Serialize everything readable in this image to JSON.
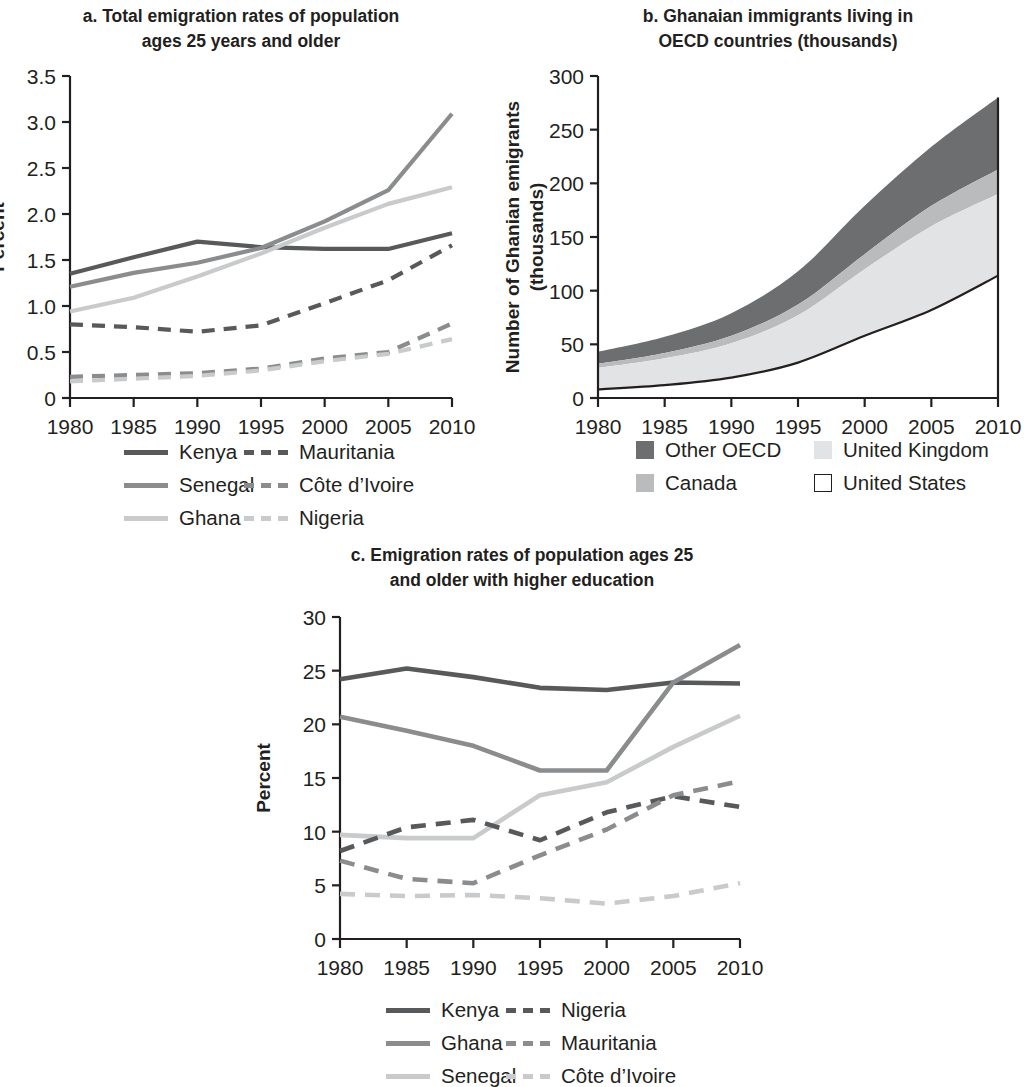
{
  "panels": {
    "a": {
      "title_line1": "a. Total emigration rates of population",
      "title_line2": "ages 25 years and older",
      "ylabel": "Percent",
      "yticks": [
        "3.5",
        "3.0",
        "2.5",
        "2.0",
        "1.5",
        "1.0",
        "0.5",
        "0"
      ],
      "xticks": [
        "1980",
        "1985",
        "1990",
        "1995",
        "2000",
        "2005",
        "2010"
      ],
      "legend": [
        {
          "label": "Kenya",
          "style": "solid",
          "color": "#58595b"
        },
        {
          "label": "Mauritania",
          "style": "dashed",
          "color": "#58595b"
        },
        {
          "label": "Senegal",
          "style": "solid",
          "color": "#8a8c8e"
        },
        {
          "label": "Côte d’Ivoire",
          "style": "dashed",
          "color": "#8a8c8e"
        },
        {
          "label": "Ghana",
          "style": "solid",
          "color": "#c8cacb"
        },
        {
          "label": "Nigeria",
          "style": "dashed",
          "color": "#c8cacb"
        }
      ]
    },
    "b": {
      "title_line1": "b. Ghanaian immigrants living in",
      "title_line2": "OECD countries (thousands)",
      "ylabel_line1": "Number of Ghanian emigrants",
      "ylabel_line2": "(thousands)",
      "yticks": [
        "300",
        "250",
        "200",
        "150",
        "100",
        "50",
        "0"
      ],
      "xticks": [
        "1980",
        "1985",
        "1990",
        "1995",
        "2000",
        "2005",
        "2010"
      ],
      "legend": [
        {
          "label": "Other OECD",
          "color": "#6d6e70",
          "swatch": "filled"
        },
        {
          "label": "United Kingdom",
          "color": "#e2e3e4",
          "swatch": "filled"
        },
        {
          "label": "Canada",
          "color": "#b9bbbd",
          "swatch": "filled"
        },
        {
          "label": "United States",
          "color": "#ffffff",
          "swatch": "outline"
        }
      ]
    },
    "c": {
      "title_line1": "c. Emigration rates of population ages 25",
      "title_line2": "and older with higher education",
      "ylabel": "Percent",
      "yticks": [
        "30",
        "25",
        "20",
        "15",
        "10",
        "5",
        "0"
      ],
      "xticks": [
        "1980",
        "1985",
        "1990",
        "1995",
        "2000",
        "2005",
        "2010"
      ],
      "legend": [
        {
          "label": "Kenya",
          "style": "solid",
          "color": "#58595b"
        },
        {
          "label": "Nigeria",
          "style": "dashed",
          "color": "#58595b"
        },
        {
          "label": "Ghana",
          "style": "solid",
          "color": "#8a8c8e"
        },
        {
          "label": "Mauritania",
          "style": "dashed",
          "color": "#8a8c8e"
        },
        {
          "label": "Senegal",
          "style": "solid",
          "color": "#c8cacb"
        },
        {
          "label": "Côte d’Ivoire",
          "style": "dashed",
          "color": "#c8cacb"
        }
      ]
    }
  },
  "chart_data": [
    {
      "panel": "a",
      "type": "line",
      "title": "a. Total emigration rates of population ages 25 years and older",
      "xlabel": "",
      "ylabel": "Percent",
      "x": [
        1980,
        1985,
        1990,
        1995,
        2000,
        2005,
        2010
      ],
      "xlim": [
        1980,
        2010
      ],
      "ylim": [
        0,
        3.5
      ],
      "ytick_values": [
        0,
        0.5,
        1.0,
        1.5,
        2.0,
        2.5,
        3.0,
        3.5
      ],
      "grid": false,
      "legend_position": "below",
      "series": [
        {
          "name": "Kenya",
          "style": "solid",
          "color": "#58595b",
          "values": [
            1.35,
            1.53,
            1.7,
            1.64,
            1.62,
            1.62,
            1.79
          ]
        },
        {
          "name": "Senegal",
          "style": "solid",
          "color": "#8a8c8e",
          "values": [
            1.21,
            1.36,
            1.47,
            1.63,
            1.92,
            2.26,
            3.09
          ]
        },
        {
          "name": "Ghana",
          "style": "solid",
          "color": "#c8cacb",
          "values": [
            0.94,
            1.09,
            1.32,
            1.57,
            1.85,
            2.11,
            2.29
          ]
        },
        {
          "name": "Mauritania",
          "style": "dashed",
          "color": "#58595b",
          "values": [
            0.8,
            0.77,
            0.72,
            0.79,
            1.03,
            1.28,
            1.66
          ]
        },
        {
          "name": "Côte d’Ivoire",
          "style": "dashed",
          "color": "#8a8c8e",
          "values": [
            0.23,
            0.25,
            0.27,
            0.32,
            0.43,
            0.5,
            0.81
          ]
        },
        {
          "name": "Nigeria",
          "style": "dashed",
          "color": "#c8cacb",
          "values": [
            0.18,
            0.21,
            0.24,
            0.3,
            0.4,
            0.48,
            0.64
          ]
        }
      ]
    },
    {
      "panel": "b",
      "type": "area",
      "title": "b. Ghanaian immigrants living in OECD countries (thousands)",
      "xlabel": "",
      "ylabel": "Number of Ghanian emigrants (thousands)",
      "x": [
        1980,
        1985,
        1990,
        1995,
        2000,
        2005,
        2010
      ],
      "xlim": [
        1980,
        2010
      ],
      "ylim": [
        0,
        300
      ],
      "ytick_values": [
        0,
        50,
        100,
        150,
        200,
        250,
        300
      ],
      "stacked": true,
      "grid": false,
      "legend_position": "below",
      "series": [
        {
          "name": "United States",
          "color": "#ffffff",
          "values": [
            8,
            12,
            19,
            33,
            58,
            82,
            114
          ]
        },
        {
          "name": "United Kingdom",
          "color": "#e2e3e4",
          "values": [
            20,
            25,
            32,
            44,
            62,
            78,
            76
          ]
        },
        {
          "name": "Canada",
          "color": "#b9bbbd",
          "values": [
            4,
            5,
            7,
            10,
            14,
            19,
            23
          ]
        },
        {
          "name": "Other OECD",
          "color": "#6d6e70",
          "values": [
            11,
            15,
            21,
            31,
            45,
            55,
            67
          ]
        }
      ],
      "cumulative_tops": {
        "United States": [
          8,
          12,
          19,
          33,
          58,
          82,
          114
        ],
        "United Kingdom": [
          28,
          37,
          51,
          77,
          120,
          160,
          190
        ],
        "Canada": [
          32,
          42,
          58,
          87,
          134,
          179,
          213
        ],
        "Other OECD": [
          43,
          57,
          79,
          118,
          179,
          234,
          280
        ]
      }
    },
    {
      "panel": "c",
      "type": "line",
      "title": "c. Emigration rates of population ages 25 and older with higher education",
      "xlabel": "",
      "ylabel": "Percent",
      "x": [
        1980,
        1985,
        1990,
        1995,
        2000,
        2005,
        2010
      ],
      "xlim": [
        1980,
        2010
      ],
      "ylim": [
        0,
        30
      ],
      "ytick_values": [
        0,
        5,
        10,
        15,
        20,
        25,
        30
      ],
      "grid": false,
      "legend_position": "below",
      "series": [
        {
          "name": "Kenya",
          "style": "solid",
          "color": "#58595b",
          "values": [
            24.2,
            25.2,
            24.4,
            23.4,
            23.2,
            23.9,
            23.8
          ]
        },
        {
          "name": "Ghana",
          "style": "solid",
          "color": "#8a8c8e",
          "values": [
            20.7,
            19.4,
            18.0,
            15.7,
            15.7,
            23.9,
            27.4
          ]
        },
        {
          "name": "Senegal",
          "style": "solid",
          "color": "#c8cacb",
          "values": [
            9.7,
            9.4,
            9.4,
            13.4,
            14.6,
            17.9,
            20.8
          ]
        },
        {
          "name": "Nigeria",
          "style": "dashed",
          "color": "#58595b",
          "values": [
            8.2,
            10.4,
            11.1,
            9.2,
            11.8,
            13.3,
            12.3
          ]
        },
        {
          "name": "Mauritania",
          "style": "dashed",
          "color": "#8a8c8e",
          "values": [
            7.3,
            5.6,
            5.2,
            7.8,
            10.2,
            13.4,
            14.7
          ]
        },
        {
          "name": "Côte d’Ivoire",
          "style": "dashed",
          "color": "#c8cacb",
          "values": [
            4.2,
            4.0,
            4.1,
            3.8,
            3.3,
            4.0,
            5.2
          ]
        }
      ]
    }
  ]
}
